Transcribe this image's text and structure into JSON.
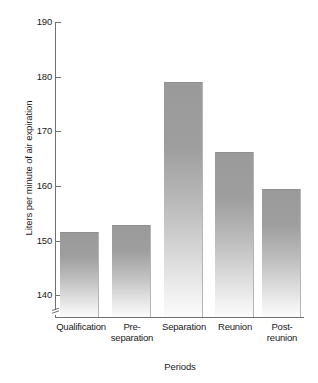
{
  "chart_data": {
    "type": "bar",
    "title": "",
    "subtitle": "",
    "xlabel": "Periods",
    "ylabel": "Liters per minute of air expiration",
    "categories": [
      "Qualification",
      "Pre-separation",
      "Separation",
      "Reunion",
      "Post-reunion"
    ],
    "category_lines": [
      [
        "Qualification"
      ],
      [
        "Pre-",
        "separation"
      ],
      [
        "Separation"
      ],
      [
        "Reunion"
      ],
      [
        "Post-",
        "reunion"
      ]
    ],
    "values": [
      151.6,
      152.9,
      179.0,
      166.2,
      159.4
    ],
    "ylim": [
      136,
      190
    ],
    "yticks": [
      190,
      180,
      170,
      160,
      150,
      140
    ],
    "ytick_labels": [
      "190",
      "180",
      "170",
      "160",
      "150",
      "140"
    ],
    "axis_break": true,
    "axis_break_note": "y-axis broken below 140",
    "grid": false,
    "legend": null,
    "bar_color_top": "#9a9a9a",
    "bar_color_bottom": "#fbfbfb",
    "axis_color": "#707070",
    "background_color": "#ffffff"
  }
}
